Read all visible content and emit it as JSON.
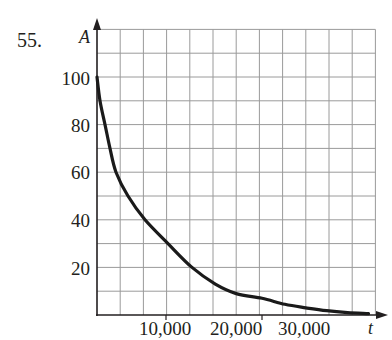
{
  "problem_number": "55.",
  "chart_data": {
    "type": "line",
    "title": "",
    "xlabel": "t",
    "ylabel": "A",
    "x_ticks": [
      10000,
      20000,
      30000
    ],
    "x_tick_labels": [
      "10,000",
      "20,000",
      "30,000"
    ],
    "y_ticks": [
      20,
      40,
      60,
      80,
      100
    ],
    "y_tick_labels": [
      "20",
      "40",
      "60",
      "80",
      "100"
    ],
    "xlim": [
      0,
      40000
    ],
    "ylim": [
      0,
      120
    ],
    "grid": true,
    "grid_x_step": 3333,
    "grid_y_step": 10,
    "legend": null,
    "series": [
      {
        "name": "A(t)",
        "x": [
          0,
          430,
          1150,
          1870,
          2730,
          4450,
          6900,
          10200,
          13650,
          17000,
          20000,
          23700,
          27000,
          30000,
          33000,
          36000,
          39000
        ],
        "y": [
          100,
          90,
          80,
          70,
          60,
          50,
          40,
          30,
          20,
          13,
          9,
          7,
          4.5,
          3,
          1.8,
          1,
          0.6
        ]
      }
    ]
  },
  "labels": {
    "y_axis": "A",
    "x_axis": "t",
    "y100": "100",
    "y80": "80",
    "y60": "60",
    "y40": "40",
    "y20": "20",
    "x10000": "10,000",
    "x20000": "20,000",
    "x30000": "30,000"
  }
}
